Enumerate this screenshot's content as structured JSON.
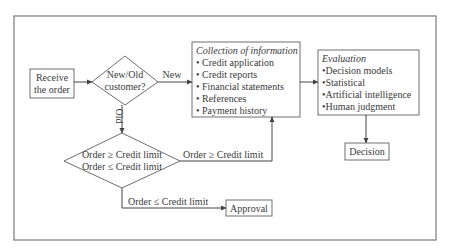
{
  "diagram": {
    "type": "flowchart",
    "nodes": {
      "receive": {
        "lines": [
          "Receive",
          "the order"
        ]
      },
      "new_old": {
        "lines": [
          "New/Old",
          "customer?"
        ]
      },
      "collection": {
        "title": "Collection of information",
        "items": [
          "• Credit application",
          "• Credit reports",
          "• Financial statements",
          "• References",
          "• Payment history"
        ]
      },
      "evaluation": {
        "title": "Evaluation",
        "items": [
          "•Decision models",
          "•Statistical",
          "•Artificial intelligence",
          "•Human judgment"
        ]
      },
      "decision": {
        "label": "Decision"
      },
      "credit_check": {
        "lines": [
          "Order ≥ Credit limit",
          "Order ≤ Credit limit"
        ]
      },
      "approval": {
        "label": "Approval"
      }
    },
    "edges": {
      "receive_to_newold": "",
      "new": "New",
      "old": "Old",
      "over_limit": "Order ≥ Credit limit",
      "under_limit": "Order ≤ Credit limit",
      "collection_to_evaluation": "",
      "evaluation_to_decision": ""
    }
  }
}
